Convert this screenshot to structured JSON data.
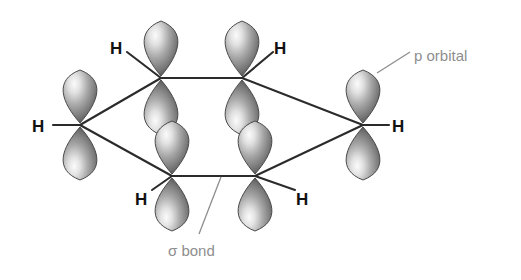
{
  "diagram": {
    "background_color": "#ffffff",
    "bond_color": "#2b2b2b",
    "orbital_colors": {
      "highlight": "#f2f2f2",
      "mid": "#9a9a9a",
      "shadow": "#5c5c5c",
      "outline": "#4a4a4a"
    },
    "annotation_color": "#8e8e8e",
    "atom_label_color": "#111111"
  },
  "annotations": [
    {
      "id": "p-orbital",
      "text": "p orbital",
      "x": 414,
      "y": 48,
      "leader": {
        "x1": 410,
        "y1": 52,
        "x2": 377,
        "y2": 73
      }
    },
    {
      "id": "sigma-bond",
      "text": "σ bond",
      "x": 168,
      "y": 243,
      "leader": {
        "x1": 221,
        "y1": 177,
        "x2": 199,
        "y2": 234
      }
    }
  ],
  "hydrogen_labels": [
    {
      "id": "h-left",
      "text": "H",
      "x": 32,
      "y": 118,
      "bond": {
        "x1": 53,
        "y1": 125,
        "x2": 80,
        "y2": 125
      }
    },
    {
      "id": "h-top-left",
      "text": "H",
      "x": 110,
      "y": 40,
      "bond": {
        "x1": 127,
        "y1": 52,
        "x2": 161,
        "y2": 78
      }
    },
    {
      "id": "h-top-right",
      "text": "H",
      "x": 274,
      "y": 40,
      "bond": {
        "x1": 273,
        "y1": 52,
        "x2": 242,
        "y2": 78
      }
    },
    {
      "id": "h-right",
      "text": "H",
      "x": 392,
      "y": 118,
      "bond": {
        "x1": 363,
        "y1": 125,
        "x2": 389,
        "y2": 125
      }
    },
    {
      "id": "h-bottom-left",
      "text": "H",
      "x": 135,
      "y": 191,
      "bond": {
        "x1": 152,
        "y1": 190,
        "x2": 172,
        "y2": 176
      }
    },
    {
      "id": "h-bottom-right",
      "text": "H",
      "x": 296,
      "y": 191,
      "bond": {
        "x1": 295,
        "y1": 190,
        "x2": 255,
        "y2": 176
      }
    }
  ],
  "ring_bonds": [
    {
      "id": "bond-top",
      "x1": 161,
      "y1": 78,
      "x2": 242,
      "y2": 78
    },
    {
      "id": "bond-upper-left",
      "x1": 80,
      "y1": 125,
      "x2": 161,
      "y2": 78
    },
    {
      "id": "bond-upper-right",
      "x1": 242,
      "y1": 78,
      "x2": 363,
      "y2": 125
    },
    {
      "id": "bond-lower-left",
      "x1": 80,
      "y1": 125,
      "x2": 172,
      "y2": 176
    },
    {
      "id": "bond-lower-right",
      "x1": 255,
      "y1": 176,
      "x2": 363,
      "y2": 125
    },
    {
      "id": "bond-bottom",
      "x1": 172,
      "y1": 176,
      "x2": 255,
      "y2": 176
    }
  ],
  "p_orbitals": [
    {
      "id": "orbital-left",
      "cx": 80,
      "cy": 125,
      "lobe_w": 26,
      "lobe_h": 55
    },
    {
      "id": "orbital-top-left",
      "cx": 161,
      "cy": 78,
      "lobe_w": 26,
      "lobe_h": 57
    },
    {
      "id": "orbital-top-right",
      "cx": 242,
      "cy": 78,
      "lobe_w": 26,
      "lobe_h": 57
    },
    {
      "id": "orbital-right",
      "cx": 363,
      "cy": 125,
      "lobe_w": 26,
      "lobe_h": 55
    },
    {
      "id": "orbital-bottom-left",
      "cx": 172,
      "cy": 176,
      "lobe_w": 26,
      "lobe_h": 55
    },
    {
      "id": "orbital-bottom-right",
      "cx": 255,
      "cy": 176,
      "lobe_w": 26,
      "lobe_h": 55
    }
  ]
}
